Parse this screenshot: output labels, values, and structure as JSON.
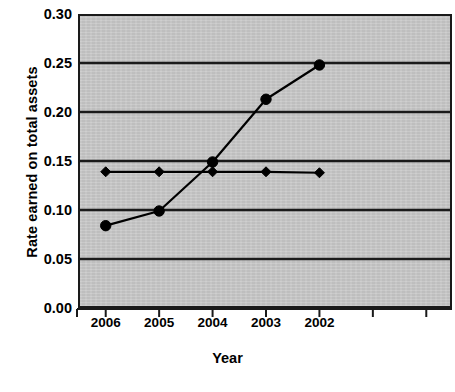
{
  "chart_data": {
    "type": "line",
    "title": "",
    "xlabel": "Year",
    "ylabel": "Rate earned on total assets",
    "categories": [
      "2006",
      "2005",
      "2004",
      "2003",
      "2002"
    ],
    "x_tick_labels": [
      "2006",
      "2005",
      "2004",
      "2003",
      "2002",
      "",
      ""
    ],
    "y_tick_labels": [
      "0.30",
      "0.25",
      "0.20",
      "0.15",
      "0.10",
      "0.05",
      "0.00"
    ],
    "y_tick_values": [
      0.3,
      0.25,
      0.2,
      0.15,
      0.1,
      0.05,
      0.0
    ],
    "ylim": [
      0.0,
      0.3
    ],
    "grid": "horizontal",
    "legend": "none",
    "plot_background_color": "#c8c8c8",
    "series": [
      {
        "name": "Rate earned on total assets",
        "marker": "circle",
        "color": "#000000",
        "values": [
          0.084,
          0.099,
          0.149,
          0.213,
          0.248
        ]
      },
      {
        "name": "Benchmark",
        "marker": "diamond",
        "color": "#000000",
        "values": [
          0.139,
          0.139,
          0.139,
          0.139,
          0.138
        ]
      }
    ]
  },
  "axis": {
    "y_title": "Rate earned on total assets",
    "x_title": "Year"
  }
}
